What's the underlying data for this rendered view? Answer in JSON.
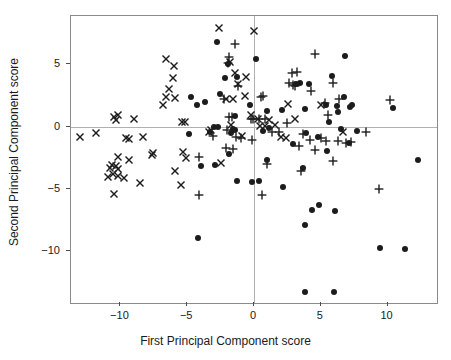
{
  "chart_data": {
    "type": "scatter",
    "title": "",
    "xlabel": "First Principal Component score",
    "ylabel": "Second Principal Component score",
    "xlim": [
      -13.7,
      13.7
    ],
    "ylim": [
      -14.2,
      8.9
    ],
    "xticks": [
      -10,
      -5,
      0,
      5,
      10
    ],
    "xticklabels": [
      "-10",
      "-5",
      "0",
      "5",
      "10"
    ],
    "yticks": [
      5,
      0,
      -5,
      -10
    ],
    "yticklabels": [
      "5",
      "0",
      "-5",
      "-10"
    ],
    "grid": false,
    "reference_lines": {
      "x": 0,
      "y": 0,
      "color": "#b0b0b0"
    },
    "legend": {
      "visible": false,
      "position": "none"
    },
    "marker_color": "#1c1c1c",
    "series": [
      {
        "name": "cross",
        "marker": "x",
        "points": [
          [
            -2.6,
            7.9
          ],
          [
            0.0,
            7.7
          ],
          [
            -6.6,
            5.4
          ],
          [
            -1.8,
            5.2
          ],
          [
            -6.0,
            4.85
          ],
          [
            -6.1,
            3.9
          ],
          [
            -6.4,
            3.0
          ],
          [
            -1.45,
            4.35
          ],
          [
            -6.6,
            2.35
          ],
          [
            -6.8,
            1.7
          ],
          [
            -5.9,
            2.3
          ],
          [
            -1.2,
            3.45
          ],
          [
            -0.6,
            4.0
          ],
          [
            -5.4,
            0.35
          ],
          [
            -5.15,
            0.35
          ],
          [
            -2.1,
            2.25
          ],
          [
            -1.55,
            2.2
          ],
          [
            -0.65,
            2.5
          ],
          [
            -0.25,
            0.9
          ],
          [
            0.3,
            0.6
          ],
          [
            1.15,
            0.5
          ],
          [
            -1.7,
            0.15
          ],
          [
            -3.2,
            -0.3
          ],
          [
            -10.5,
            0.75
          ],
          [
            -10.35,
            0.55
          ],
          [
            -10.2,
            0.9
          ],
          [
            -8.95,
            0.6
          ],
          [
            -13.0,
            -0.8
          ],
          [
            -11.8,
            -0.55
          ],
          [
            -9.35,
            -1.0
          ],
          [
            -9.6,
            -0.95
          ],
          [
            -8.3,
            -0.85
          ],
          [
            -7.55,
            -2.1
          ],
          [
            -7.65,
            -2.25
          ],
          [
            -10.2,
            -2.45
          ],
          [
            -10.6,
            -3.1
          ],
          [
            -10.35,
            -3.15
          ],
          [
            -10.75,
            -3.3
          ],
          [
            -10.15,
            -3.45
          ],
          [
            -10.9,
            -4.05
          ],
          [
            -10.55,
            -3.8
          ],
          [
            -9.35,
            -2.65
          ],
          [
            -9.75,
            -4.1
          ],
          [
            -10.2,
            -3.95
          ],
          [
            -8.5,
            -4.55
          ],
          [
            -10.45,
            -5.4
          ],
          [
            -5.9,
            -3.6
          ],
          [
            -5.3,
            -2.05
          ],
          [
            -5.1,
            -2.5
          ],
          [
            -5.45,
            -4.7
          ],
          [
            -2.5,
            -2.9
          ],
          [
            -3.35,
            -0.45
          ],
          [
            2.55,
            1.8
          ],
          [
            3.05,
            0.6
          ],
          [
            2.4,
            -0.9
          ],
          [
            2.0,
            -0.85
          ],
          [
            5.05,
            1.75
          ],
          [
            0.45,
            0.05
          ],
          [
            6.65,
            -0.45
          ],
          [
            0.8,
            0.05
          ],
          [
            -0.9,
            -0.75
          ],
          [
            1.6,
            0.1
          ]
        ]
      },
      {
        "name": "plus",
        "marker": "+",
        "points": [
          [
            -1.4,
            6.65
          ],
          [
            -1.9,
            5.6
          ],
          [
            -1.95,
            5.15
          ],
          [
            4.6,
            5.85
          ],
          [
            2.85,
            4.35
          ],
          [
            3.25,
            4.4
          ],
          [
            2.65,
            3.5
          ],
          [
            3.1,
            3.3
          ],
          [
            4.3,
            2.85
          ],
          [
            5.9,
            3.5
          ],
          [
            6.35,
            2.2
          ],
          [
            10.2,
            2.1
          ],
          [
            -1.2,
            3.25
          ],
          [
            0.5,
            2.4
          ],
          [
            0.65,
            2.5
          ],
          [
            -2.25,
            2.25
          ],
          [
            -1.85,
            0.75
          ],
          [
            -1.65,
            0.75
          ],
          [
            -0.2,
            0.65
          ],
          [
            -0.05,
            0.6
          ],
          [
            0.35,
            0.65
          ],
          [
            0.85,
            0.65
          ],
          [
            5.3,
            1.9
          ],
          [
            5.55,
            0.95
          ],
          [
            2.5,
            0.3
          ],
          [
            -3.05,
            -0.75
          ],
          [
            -2.05,
            -0.25
          ],
          [
            -1.0,
            -0.95
          ],
          [
            -0.15,
            -1.05
          ],
          [
            1.85,
            -0.45
          ],
          [
            3.7,
            -0.6
          ],
          [
            4.2,
            -1.1
          ],
          [
            5.05,
            -0.95
          ],
          [
            5.4,
            -1.15
          ],
          [
            6.3,
            -1.15
          ],
          [
            6.9,
            -1.3
          ],
          [
            7.25,
            -1.25
          ],
          [
            8.4,
            -0.45
          ],
          [
            -2.1,
            -1.7
          ],
          [
            -1.55,
            -1.8
          ],
          [
            -4.15,
            -2.45
          ],
          [
            3.4,
            -1.55
          ],
          [
            4.6,
            -1.9
          ],
          [
            5.9,
            -2.8
          ],
          [
            0.95,
            -3.0
          ],
          [
            3.5,
            -3.55
          ],
          [
            -4.1,
            -5.5
          ],
          [
            0.6,
            -5.5
          ],
          [
            9.35,
            -5.05
          ],
          [
            -1.35,
            -0.85
          ],
          [
            1.35,
            -0.45
          ],
          [
            2.9,
            3.35
          ]
        ]
      },
      {
        "name": "dot",
        "marker": "o",
        "points": [
          [
            -2.8,
            6.8
          ],
          [
            6.8,
            5.65
          ],
          [
            0.15,
            5.45
          ],
          [
            -1.95,
            5.0
          ],
          [
            -2.2,
            3.9
          ],
          [
            -1.25,
            4.0
          ],
          [
            5.85,
            4.1
          ],
          [
            3.15,
            3.4
          ],
          [
            3.45,
            3.5
          ],
          [
            4.1,
            3.45
          ],
          [
            6.75,
            2.4
          ],
          [
            -4.7,
            2.35
          ],
          [
            -4.3,
            1.75
          ],
          [
            -3.7,
            1.95
          ],
          [
            -2.55,
            2.6
          ],
          [
            5.4,
            1.7
          ],
          [
            6.2,
            1.65
          ],
          [
            7.2,
            1.6
          ],
          [
            7.3,
            1.75
          ],
          [
            6.3,
            1.15
          ],
          [
            3.8,
            1.45
          ],
          [
            10.4,
            1.5
          ],
          [
            -0.3,
            1.75
          ],
          [
            0.95,
            1.25
          ],
          [
            2.1,
            1.3
          ],
          [
            -1.4,
            0.85
          ],
          [
            5.6,
            0.4
          ],
          [
            6.5,
            -0.2
          ],
          [
            7.7,
            -0.35
          ],
          [
            1.1,
            -0.1
          ],
          [
            0.65,
            -0.35
          ],
          [
            -3.0,
            -0.05
          ],
          [
            -3.3,
            -0.4
          ],
          [
            -2.7,
            -0.05
          ],
          [
            -1.6,
            -0.2
          ],
          [
            -1.75,
            -0.5
          ],
          [
            -1.4,
            -0.3
          ],
          [
            -4.9,
            -0.6
          ],
          [
            3.9,
            -0.5
          ],
          [
            4.8,
            -0.85
          ],
          [
            7.1,
            -1.3
          ],
          [
            2.9,
            -1.4
          ],
          [
            5.5,
            -2.0
          ],
          [
            -4.0,
            -3.2
          ],
          [
            -2.95,
            -3.1
          ],
          [
            1.0,
            -2.7
          ],
          [
            3.65,
            -3.3
          ],
          [
            -1.25,
            -4.35
          ],
          [
            0.35,
            -4.4
          ],
          [
            2.2,
            -4.85
          ],
          [
            -0.15,
            -4.5
          ],
          [
            12.3,
            -2.7
          ],
          [
            4.35,
            -6.7
          ],
          [
            4.9,
            -6.3
          ],
          [
            6.1,
            -6.8
          ],
          [
            3.85,
            -7.95
          ],
          [
            -4.2,
            -8.95
          ],
          [
            9.4,
            -9.8
          ],
          [
            11.3,
            -9.85
          ],
          [
            3.8,
            -13.3
          ],
          [
            6.0,
            -13.3
          ],
          [
            -1.85,
            -2.2
          ]
        ]
      }
    ]
  }
}
